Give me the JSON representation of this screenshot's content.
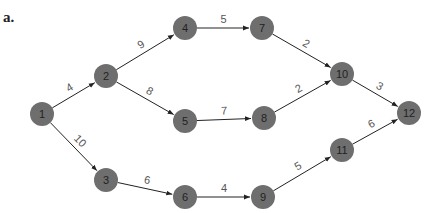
{
  "figure": {
    "label": "a.",
    "node_color": "#6e6e6e",
    "edge_color": "#222222"
  },
  "nodes": [
    {
      "id": "1",
      "x": 42,
      "y": 114
    },
    {
      "id": "2",
      "x": 106,
      "y": 76
    },
    {
      "id": "3",
      "x": 106,
      "y": 180
    },
    {
      "id": "4",
      "x": 185,
      "y": 28
    },
    {
      "id": "5",
      "x": 185,
      "y": 121
    },
    {
      "id": "6",
      "x": 185,
      "y": 197
    },
    {
      "id": "7",
      "x": 262,
      "y": 28
    },
    {
      "id": "8",
      "x": 264,
      "y": 118
    },
    {
      "id": "9",
      "x": 263,
      "y": 197
    },
    {
      "id": "10",
      "x": 342,
      "y": 74
    },
    {
      "id": "11",
      "x": 342,
      "y": 150
    },
    {
      "id": "12",
      "x": 409,
      "y": 113
    }
  ],
  "edges": [
    {
      "from": "1",
      "to": "2",
      "weight": "4"
    },
    {
      "from": "1",
      "to": "3",
      "weight": "10"
    },
    {
      "from": "2",
      "to": "4",
      "weight": "9"
    },
    {
      "from": "2",
      "to": "5",
      "weight": "8"
    },
    {
      "from": "3",
      "to": "6",
      "weight": "6"
    },
    {
      "from": "4",
      "to": "7",
      "weight": "5"
    },
    {
      "from": "5",
      "to": "8",
      "weight": "7"
    },
    {
      "from": "6",
      "to": "9",
      "weight": "4"
    },
    {
      "from": "7",
      "to": "10",
      "weight": "2"
    },
    {
      "from": "8",
      "to": "10",
      "weight": "2"
    },
    {
      "from": "9",
      "to": "11",
      "weight": "5"
    },
    {
      "from": "10",
      "to": "12",
      "weight": "3"
    },
    {
      "from": "11",
      "to": "12",
      "weight": "6"
    }
  ]
}
